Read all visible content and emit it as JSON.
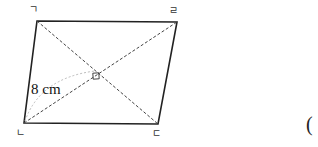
{
  "figure": {
    "shape": "parallelogram",
    "vertices": [
      {
        "id": "A",
        "label": "ㄱ",
        "position": "top-left"
      },
      {
        "id": "D",
        "label": "ㄹ",
        "position": "top-right"
      },
      {
        "id": "B",
        "label": "ㄴ",
        "position": "bottom-left"
      },
      {
        "id": "C",
        "label": "ㄷ",
        "position": "bottom-right"
      }
    ],
    "diagonals": "dashed, intersecting at right angle",
    "right_angle_marker": true,
    "measurement": {
      "label": "8 cm",
      "segment": "from ㄴ to diagonal intersection"
    }
  },
  "answer_blank": {
    "open_paren": "("
  },
  "colors": {
    "stroke": "#222222",
    "dashed": "#444444",
    "arc": "#bbbbbb"
  }
}
